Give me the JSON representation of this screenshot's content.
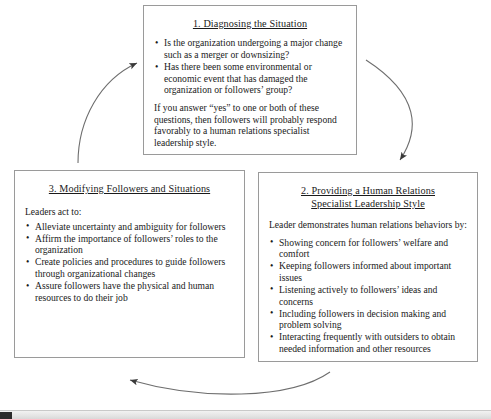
{
  "diagram": {
    "title_shown": false,
    "nodes": [
      {
        "id": "box1",
        "number": "1.",
        "title": "1. Diagnosing the Situation",
        "lead": "",
        "bullets": [
          "Is the organization undergoing a major change such as a merger or downsizing?",
          "Has there been some environmental or economic event that has damaged the organization or followers’ group?"
        ],
        "paragraph": "If you answer “yes” to one or both of these questions, then followers will probably respond favorably to a human relations specialist leadership style."
      },
      {
        "id": "box2",
        "number": "2.",
        "title": "2. Providing a Human Relations Specialist Leadership Style",
        "title_line1": "2. Providing a Human Relations",
        "title_line2": "Specialist Leadership Style",
        "lead": "Leader demonstrates human relations behaviors by:",
        "bullets": [
          "Showing concern for followers’ welfare and comfort",
          "Keeping followers informed about important issues",
          "Listening actively to followers’ ideas and concerns",
          "Including followers in decision making and problem solving",
          "Interacting frequently with outsiders to obtain needed information and other resources"
        ],
        "paragraph": ""
      },
      {
        "id": "box3",
        "number": "3.",
        "title": "3. Modifying Followers and Situations",
        "lead": "Leaders act to:",
        "bullets": [
          "Alleviate uncertainty and ambiguity for followers",
          "Affirm the importance of followers’ roles to the organization",
          "Create policies and procedures to guide followers through organizational changes",
          "Assure followers have the physical and human resources to do their job"
        ],
        "paragraph": ""
      }
    ],
    "arrows": [
      {
        "name": "arrow-box1-to-box2",
        "from": "box1",
        "to": "box2",
        "direction": "clockwise"
      },
      {
        "name": "arrow-box2-to-box3",
        "from": "box2",
        "to": "box3",
        "direction": "clockwise"
      },
      {
        "name": "arrow-box3-to-box1",
        "from": "box3",
        "to": "box1",
        "direction": "clockwise"
      }
    ],
    "colors": {
      "background": "#ffffff",
      "box_border": "#9a9a9a",
      "text": "#1a1a1a",
      "arrow": "#4a4a4a"
    }
  },
  "taskbar": {
    "label": ""
  }
}
